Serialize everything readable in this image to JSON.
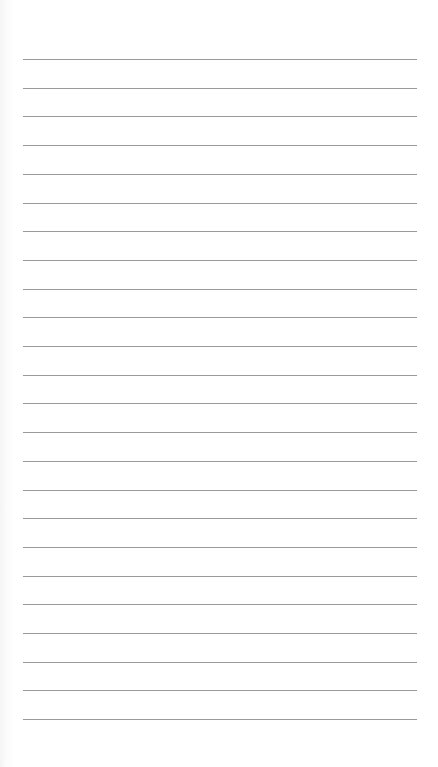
{
  "page": {
    "type": "lined-paper",
    "background_color": "#ffffff",
    "rule_color": "#9a9a9a",
    "rule_count": 24,
    "first_rule_y": 59,
    "rule_spacing": 28.7,
    "rule_left": 23,
    "rule_right": 417
  }
}
